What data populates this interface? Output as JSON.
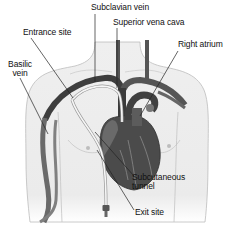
{
  "diagram": {
    "colors": {
      "skin": "#ededed",
      "skin_outline": "#b8b8b8",
      "vessel_dark": "#3a3a3a",
      "vessel_mid": "#6e6e6e",
      "heart": "#4a4a4a",
      "catheter": "#f4f4f4",
      "leader_line": "#222222"
    },
    "labels": {
      "subclavian_vein": "Subclavian vein",
      "superior_vena_cava": "Superior vena cava",
      "entrance_site": "Entrance site",
      "right_atrium": "Right atrium",
      "basilic_vein_line1": "Basilic",
      "basilic_vein_line2": "vein",
      "subcutaneous_tunnel_line1": "Subcutaneous",
      "subcutaneous_tunnel_line2": "tunnel",
      "exit_site": "Exit site"
    }
  }
}
